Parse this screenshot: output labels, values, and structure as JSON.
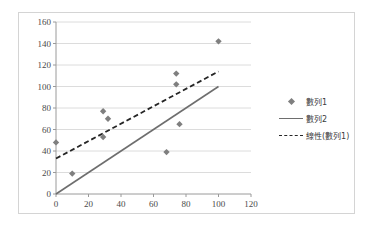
{
  "chart_data": {
    "type": "scatter",
    "title": "",
    "xlabel": "",
    "ylabel": "",
    "xlim": [
      0,
      120
    ],
    "ylim": [
      0,
      160
    ],
    "xticks": [
      "0",
      "20",
      "40",
      "60",
      "80",
      "100",
      "120"
    ],
    "yticks": [
      "0",
      "20",
      "40",
      "60",
      "80",
      "100",
      "120",
      "140",
      "160"
    ],
    "grid": "horizontal",
    "legend_position": "right",
    "series": [
      {
        "name": "數列1",
        "type": "scatter",
        "marker": "diamond",
        "color": "#7f7f7f",
        "points": [
          [
            0,
            48
          ],
          [
            10,
            19
          ],
          [
            29,
            77
          ],
          [
            29,
            53
          ],
          [
            32,
            70
          ],
          [
            68,
            39
          ],
          [
            74,
            112
          ],
          [
            74,
            102
          ],
          [
            76,
            65
          ],
          [
            100,
            142
          ]
        ]
      },
      {
        "name": "數列2",
        "type": "line",
        "style": "solid",
        "color": "#6e6e6e",
        "x": [
          0,
          100
        ],
        "values": [
          0,
          100
        ]
      },
      {
        "name": "線性(數列1)",
        "type": "line",
        "style": "dashed",
        "color": "#262626",
        "x": [
          0,
          100
        ],
        "values": [
          33,
          114
        ]
      }
    ]
  },
  "legend": {
    "entries": [
      {
        "label": "數列1",
        "key": "diamond-marker"
      },
      {
        "label": "數列2",
        "key": "solid-line"
      },
      {
        "label": "線性(數列1)",
        "key": "dashed-line"
      }
    ]
  },
  "colors": {
    "frame": "#d4d4d4",
    "gridline": "#dcdcdc",
    "axis": "#9a9a9a",
    "marker": "#7f7f7f",
    "series_line": "#6e6e6e",
    "trendline": "#262626",
    "tick_text": "#4a4a4a"
  }
}
